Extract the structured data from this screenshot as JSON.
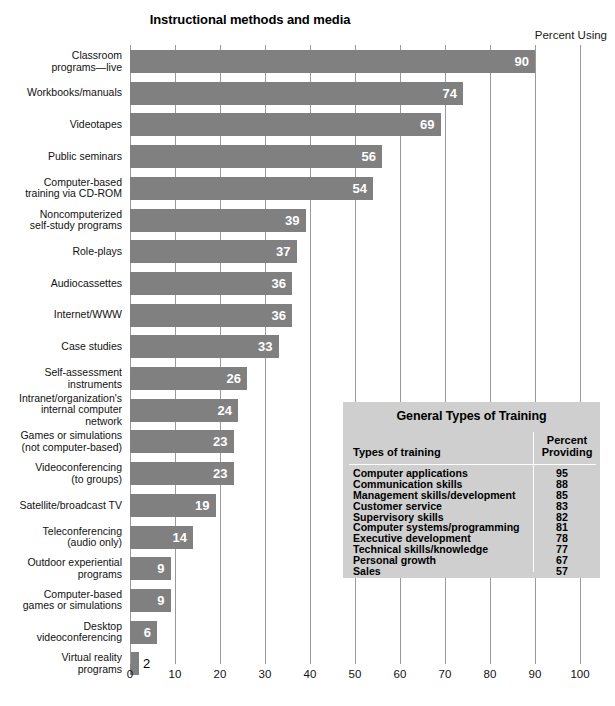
{
  "chart_data": {
    "type": "bar",
    "orientation": "horizontal",
    "title": "Instructional methods and media",
    "axis_caption": "Percent Using",
    "xlabel": "",
    "ylabel": "",
    "xlim": [
      0,
      100
    ],
    "xticks": [
      0,
      10,
      20,
      30,
      40,
      50,
      60,
      70,
      80,
      90,
      100
    ],
    "grid": true,
    "grid_axis": "x",
    "legend": false,
    "bar_color": "#808080",
    "categories": [
      "Classroom\nprograms—live",
      "Workbooks/manuals",
      "Videotapes",
      "Public seminars",
      "Computer-based\ntraining via CD-ROM",
      "Noncomputerized\nself-study programs",
      "Role-plays",
      "Audiocassettes",
      "Internet/WWW",
      "Case studies",
      "Self-assessment\ninstruments",
      "Intranet/organization's\ninternal computer\nnetwork",
      "Games or simulations\n(not computer-based)",
      "Videoconferencing\n(to groups)",
      "Satellite/broadcast TV",
      "Teleconferencing\n(audio only)",
      "Outdoor experiential\nprograms",
      "Computer-based\ngames or simulations",
      "Desktop\nvideoconferencing",
      "Virtual reality\nprograms"
    ],
    "values": [
      90,
      74,
      69,
      56,
      54,
      39,
      37,
      36,
      36,
      33,
      26,
      24,
      23,
      23,
      19,
      14,
      9,
      9,
      6,
      2
    ]
  },
  "inset_table": {
    "title": "General Types of Training",
    "columns": [
      "Types of training",
      "Percent\nProviding"
    ],
    "column_header_left": "Types of training",
    "column_header_right_line1": "Percent",
    "column_header_right_line2": "Providing",
    "rows": [
      {
        "name": "Computer applications",
        "value": "95"
      },
      {
        "name": "Communication skills",
        "value": "88"
      },
      {
        "name": "Management skills/development",
        "value": "85"
      },
      {
        "name": "Customer service",
        "value": "83"
      },
      {
        "name": "Supervisory skills",
        "value": "82"
      },
      {
        "name": "Computer systems/programming",
        "value": "81"
      },
      {
        "name": "Executive development",
        "value": "78"
      },
      {
        "name": "Technical skills/knowledge",
        "value": "77"
      },
      {
        "name": "Personal growth",
        "value": "67"
      },
      {
        "name": "Sales",
        "value": "57"
      }
    ]
  },
  "colors": {
    "bar": "#808080",
    "grid": "#9a9a9a",
    "table_background": "#cfcfcf",
    "text": "#000000",
    "bar_label": "#ffffff"
  }
}
